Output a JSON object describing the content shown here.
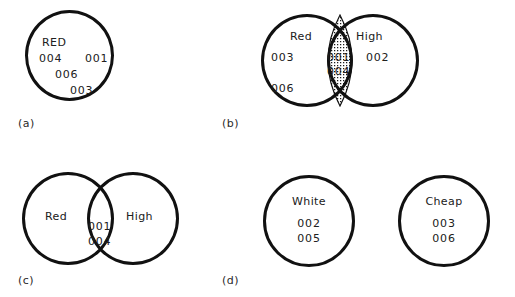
{
  "figure": {
    "title": "",
    "background_color": "#ffffff",
    "stroke_color": "#111111",
    "text_color": "#202020",
    "panels": [
      {
        "caption": "(a)",
        "type": "single-set",
        "sets": [
          {
            "label": "RED",
            "members": [
              "004",
              "001",
              "006",
              "003"
            ]
          }
        ],
        "intersection": {
          "members": [],
          "shaded": false
        }
      },
      {
        "caption": "(b)",
        "type": "two-set-overlap-shaded",
        "sets": [
          {
            "label": "Red",
            "members": [
              "003",
              "006"
            ]
          },
          {
            "label": "High",
            "members": [
              "002"
            ]
          }
        ],
        "intersection": {
          "members": [
            "001",
            "004"
          ],
          "shaded": true
        }
      },
      {
        "caption": "(c)",
        "type": "two-set-overlap",
        "sets": [
          {
            "label": "Red",
            "members": []
          },
          {
            "label": "High",
            "members": []
          }
        ],
        "intersection": {
          "members": [
            "001",
            "004"
          ],
          "shaded": false
        }
      },
      {
        "caption": "(d)",
        "type": "two-set-disjoint",
        "sets": [
          {
            "label": "White",
            "members": [
              "002",
              "005"
            ]
          },
          {
            "label": "Cheap",
            "members": [
              "003",
              "006"
            ]
          }
        ],
        "intersection": {
          "members": [],
          "shaded": false
        }
      }
    ]
  },
  "labels": {
    "a": {
      "caption": "(a)",
      "set_name": "RED",
      "code_1": "004",
      "code_2": "001",
      "code_3": "006",
      "code_4": "003"
    },
    "b": {
      "caption": "(b)",
      "left_name": "Red",
      "right_name": "High",
      "left_code_1": "003",
      "left_code_2": "006",
      "right_code_1": "002",
      "mid_code_1": "001",
      "mid_code_2": "004"
    },
    "c": {
      "caption": "(c)",
      "left_name": "Red",
      "right_name": "High",
      "mid_code_1": "001",
      "mid_code_2": "004"
    },
    "d": {
      "caption": "(d)",
      "left_name": "White",
      "right_name": "Cheap",
      "left_code_1": "002",
      "left_code_2": "005",
      "right_code_1": "003",
      "right_code_2": "006"
    }
  }
}
